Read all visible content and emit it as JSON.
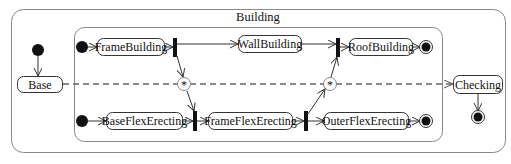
{
  "diagram": {
    "type": "uml-state-machine",
    "composite_state": {
      "label": "Building"
    },
    "states": {
      "base": "Base",
      "frame_building": "FrameBuilding",
      "wall_building": "WallBuilding",
      "roof_building": "RoofBuilding",
      "base_flex_erecting": "BaseFlexErecting",
      "frame_flex_erecting": "FrameFlexErecting",
      "outer_flex_erecting": "OuterFlexErecting",
      "checking": "Checking"
    },
    "sync_states": {
      "left": "*",
      "right": "*"
    },
    "transitions": [
      {
        "from": "initial",
        "to": "Base"
      },
      {
        "from": "Base",
        "to": "Checking",
        "style": "dashed"
      },
      {
        "from": "initial",
        "to": "FrameBuilding"
      },
      {
        "from": "FrameBuilding",
        "to": "fork-1"
      },
      {
        "from": "fork-1",
        "to": "WallBuilding"
      },
      {
        "from": "fork-1",
        "to": "sync-left"
      },
      {
        "from": "WallBuilding",
        "to": "join-1"
      },
      {
        "from": "join-1",
        "to": "RoofBuilding"
      },
      {
        "from": "RoofBuilding",
        "to": "final"
      },
      {
        "from": "initial",
        "to": "BaseFlexErecting"
      },
      {
        "from": "BaseFlexErecting",
        "to": "join-2"
      },
      {
        "from": "sync-left",
        "to": "join-2"
      },
      {
        "from": "join-2",
        "to": "FrameFlexErecting"
      },
      {
        "from": "FrameFlexErecting",
        "to": "fork-2"
      },
      {
        "from": "fork-2",
        "to": "OuterFlexErecting"
      },
      {
        "from": "fork-2",
        "to": "sync-right"
      },
      {
        "from": "sync-right",
        "to": "join-1"
      },
      {
        "from": "OuterFlexErecting",
        "to": "final"
      },
      {
        "from": "Checking",
        "to": "final"
      }
    ]
  }
}
